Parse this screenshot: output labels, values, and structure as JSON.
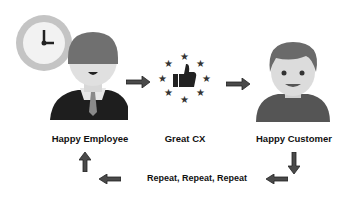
{
  "nodes": [
    {
      "id": "employee",
      "label": "Happy Employee",
      "icon": "employee-with-clock-icon"
    },
    {
      "id": "cx",
      "label": "Great CX",
      "icon": "thumbs-up-stars-icon"
    },
    {
      "id": "customer",
      "label": "Happy Customer",
      "icon": "customer-avatar-icon"
    }
  ],
  "loop_label": "Repeat, Repeat, Repeat",
  "arrows": [
    "arrow-right",
    "arrow-right",
    "arrow-down",
    "arrow-left",
    "arrow-left",
    "arrow-up"
  ],
  "colors": {
    "arrow": "#4a4a4a",
    "text": "#111111",
    "clock_ring": "#c4c4c4",
    "hair": "#707070",
    "skin": "#dcdcdc",
    "shirt_dark": "#1e1e1e",
    "shirt_customer": "#555555"
  }
}
